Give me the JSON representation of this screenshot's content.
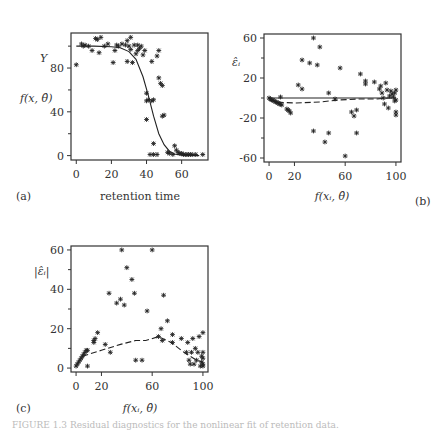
{
  "chart_data": [
    {
      "panel": "a",
      "type": "scatter",
      "panel_label": "(a)",
      "xlabel": "retention time",
      "ylabel_top": "Y",
      "ylabel_bottom": "f(x, θ̂)",
      "xlim": [
        -3,
        75
      ],
      "ylim": [
        -4,
        112
      ],
      "xticks": [
        0,
        20,
        40,
        60
      ],
      "yticks": [
        0,
        40,
        80
      ],
      "grid": false,
      "series": [
        {
          "name": "observed Y",
          "marker": "*",
          "points": [
            [
              0,
              83
            ],
            [
              3,
              102
            ],
            [
              4,
              100
            ],
            [
              5,
              101
            ],
            [
              7,
              100
            ],
            [
              9,
              96
            ],
            [
              11,
              107
            ],
            [
              12,
              106
            ],
            [
              13,
              94
            ],
            [
              14,
              108
            ],
            [
              16,
              100
            ],
            [
              18,
              102
            ],
            [
              21,
              85
            ],
            [
              22,
              96
            ],
            [
              23,
              101
            ],
            [
              24,
              100
            ],
            [
              26,
              102
            ],
            [
              28,
              101
            ],
            [
              29,
              86
            ],
            [
              29,
              105
            ],
            [
              30,
              100
            ],
            [
              31,
              108
            ],
            [
              31,
              97
            ],
            [
              32,
              85
            ],
            [
              33,
              101
            ],
            [
              34,
              93
            ],
            [
              35,
              96
            ],
            [
              35,
              101
            ],
            [
              36,
              98
            ],
            [
              37,
              100
            ],
            [
              38,
              92
            ],
            [
              39,
              96
            ],
            [
              40,
              57
            ],
            [
              40,
              50
            ],
            [
              40,
              33
            ],
            [
              41,
              51
            ],
            [
              43,
              50
            ],
            [
              43,
              86
            ],
            [
              44,
              51
            ],
            [
              44,
              11
            ],
            [
              42,
              1
            ],
            [
              44,
              1
            ],
            [
              46,
              1
            ],
            [
              46,
              91
            ],
            [
              47,
              96
            ],
            [
              47,
              71
            ],
            [
              48,
              66
            ],
            [
              49,
              64
            ],
            [
              49,
              36
            ],
            [
              50,
              37
            ],
            [
              52,
              3
            ],
            [
              53,
              2
            ],
            [
              55,
              1
            ],
            [
              56,
              9
            ],
            [
              57,
              5
            ],
            [
              58,
              3
            ],
            [
              59,
              2
            ],
            [
              60,
              2
            ],
            [
              61,
              1
            ],
            [
              62,
              1
            ],
            [
              63,
              1
            ],
            [
              64,
              1
            ],
            [
              65,
              1
            ],
            [
              66,
              1
            ],
            [
              68,
              1
            ],
            [
              72,
              1
            ]
          ]
        },
        {
          "name": "fitted f(x, θ̂)",
          "type": "line",
          "points": [
            [
              0,
              100
            ],
            [
              10,
              100
            ],
            [
              20,
              99.5
            ],
            [
              25,
              98.5
            ],
            [
              30,
              95
            ],
            [
              34,
              88
            ],
            [
              38,
              72
            ],
            [
              41,
              55
            ],
            [
              44,
              36
            ],
            [
              47,
              20
            ],
            [
              50,
              10
            ],
            [
              53,
              4
            ],
            [
              56,
              1.5
            ],
            [
              60,
              0.5
            ],
            [
              70,
              0
            ]
          ]
        }
      ]
    },
    {
      "panel": "b",
      "type": "scatter",
      "panel_label": "(b)",
      "xlabel": "f(x_i, θ̂)",
      "ylabel": "ε̂_i",
      "xlim": [
        -4,
        104
      ],
      "ylim": [
        -64,
        64
      ],
      "xticks": [
        0,
        20,
        60,
        100
      ],
      "yticks": [
        -60,
        -20,
        20,
        60
      ],
      "grid": false,
      "series": [
        {
          "name": "residuals",
          "marker": "*",
          "points": [
            [
              0,
              0
            ],
            [
              1,
              -1
            ],
            [
              2,
              -2
            ],
            [
              3,
              -2
            ],
            [
              4,
              -3
            ],
            [
              5,
              -4
            ],
            [
              6,
              -4
            ],
            [
              7,
              -5
            ],
            [
              8,
              -6
            ],
            [
              9,
              -6
            ],
            [
              9,
              1
            ],
            [
              10,
              -7
            ],
            [
              14,
              -11
            ],
            [
              15,
              -12
            ],
            [
              16,
              -13
            ],
            [
              17,
              -15
            ],
            [
              23,
              13
            ],
            [
              26,
              9
            ],
            [
              26,
              38
            ],
            [
              32,
              35
            ],
            [
              35,
              -33
            ],
            [
              35,
              60
            ],
            [
              38,
              33
            ],
            [
              40,
              51
            ],
            [
              44,
              -44
            ],
            [
              47,
              5
            ],
            [
              47,
              -35
            ],
            [
              52,
              -1
            ],
            [
              56,
              30
            ],
            [
              60,
              -58
            ],
            [
              65,
              -14
            ],
            [
              67,
              -18
            ],
            [
              69,
              -12
            ],
            [
              69,
              -35
            ],
            [
              72,
              24
            ],
            [
              76,
              14
            ],
            [
              76,
              17
            ],
            [
              83,
              16
            ],
            [
              87,
              9
            ],
            [
              88,
              12
            ],
            [
              89,
              5
            ],
            [
              90,
              0
            ],
            [
              91,
              -6
            ],
            [
              92,
              15
            ],
            [
              93,
              8
            ],
            [
              94,
              -10
            ],
            [
              95,
              2
            ],
            [
              96,
              7
            ],
            [
              97,
              4
            ],
            [
              98,
              1
            ],
            [
              99,
              -3
            ],
            [
              99,
              5
            ],
            [
              100,
              -14
            ],
            [
              100,
              -17
            ],
            [
              100,
              -2
            ],
            [
              100,
              8
            ]
          ]
        },
        {
          "name": "zero line",
          "type": "line",
          "style": "solid",
          "points": [
            [
              0,
              0
            ],
            [
              100,
              0
            ]
          ]
        },
        {
          "name": "smooth",
          "type": "line",
          "style": "dashed",
          "points": [
            [
              0,
              -2
            ],
            [
              5,
              -4
            ],
            [
              20,
              -5
            ],
            [
              40,
              -4
            ],
            [
              55,
              -2
            ],
            [
              70,
              -1
            ],
            [
              85,
              -1
            ],
            [
              95,
              0
            ],
            [
              100,
              0
            ]
          ]
        }
      ]
    },
    {
      "panel": "c",
      "type": "scatter",
      "panel_label": "(c)",
      "xlabel": "f(x_i, θ̂)",
      "ylabel": "|ε̂_i|",
      "xlim": [
        -4,
        104
      ],
      "ylim": [
        -2,
        62
      ],
      "xticks": [
        0,
        20,
        60,
        100
      ],
      "yticks": [
        0,
        20,
        40,
        60
      ],
      "grid": false,
      "series": [
        {
          "name": "absolute residuals",
          "marker": "*",
          "points": [
            [
              0,
              1
            ],
            [
              1,
              2
            ],
            [
              2,
              3
            ],
            [
              3,
              4
            ],
            [
              4,
              5
            ],
            [
              5,
              6
            ],
            [
              6,
              7
            ],
            [
              7,
              8
            ],
            [
              8,
              9
            ],
            [
              9,
              1
            ],
            [
              9,
              9
            ],
            [
              14,
              13
            ],
            [
              14,
              14
            ],
            [
              15,
              15
            ],
            [
              17,
              18
            ],
            [
              23,
              12
            ],
            [
              26,
              38
            ],
            [
              27,
              8
            ],
            [
              32,
              33
            ],
            [
              35,
              35
            ],
            [
              36,
              60
            ],
            [
              38,
              32
            ],
            [
              40,
              51
            ],
            [
              44,
              45
            ],
            [
              46,
              38
            ],
            [
              47,
              4
            ],
            [
              52,
              4
            ],
            [
              56,
              29
            ],
            [
              60,
              60
            ],
            [
              65,
              16
            ],
            [
              67,
              20
            ],
            [
              68,
              14
            ],
            [
              69,
              37
            ],
            [
              72,
              24
            ],
            [
              76,
              17
            ],
            [
              76,
              13
            ],
            [
              83,
              15
            ],
            [
              87,
              8
            ],
            [
              88,
              13
            ],
            [
              89,
              4
            ],
            [
              90,
              2
            ],
            [
              91,
              8
            ],
            [
              92,
              15
            ],
            [
              93,
              2
            ],
            [
              94,
              10
            ],
            [
              95,
              4
            ],
            [
              96,
              8
            ],
            [
              97,
              16
            ],
            [
              98,
              1
            ],
            [
              99,
              6
            ],
            [
              99,
              3
            ],
            [
              100,
              18
            ],
            [
              100,
              5
            ],
            [
              100,
              2
            ],
            [
              100,
              8
            ],
            [
              100,
              1
            ]
          ]
        },
        {
          "name": "smooth",
          "type": "line",
          "style": "dashed",
          "points": [
            [
              5,
              6
            ],
            [
              20,
              9
            ],
            [
              35,
              12
            ],
            [
              47,
              14
            ],
            [
              55,
              14
            ],
            [
              65,
              16
            ],
            [
              75,
              13
            ],
            [
              85,
              8
            ],
            [
              95,
              4
            ],
            [
              100,
              3
            ]
          ]
        }
      ]
    }
  ],
  "caption": "FIGURE 1.3  Residual diagnostics for the nonlinear fit of retention data."
}
